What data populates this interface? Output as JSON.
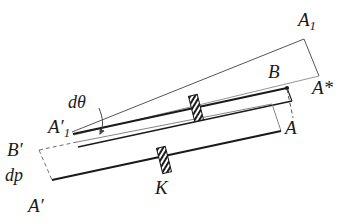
{
  "figure": {
    "background_color": "#ffffff",
    "stroke_color": "#1a1a1a",
    "thin_stroke_color": "#555555",
    "dashed_stroke_color": "#707070",
    "labels": {
      "A1": {
        "base": "A",
        "sub": "1",
        "prime": ""
      },
      "B": {
        "base": "B",
        "sub": "",
        "prime": ""
      },
      "A_star": {
        "base": "A",
        "sub": "",
        "prime": "*"
      },
      "A": {
        "base": "A",
        "sub": "",
        "prime": ""
      },
      "d_theta": {
        "text": "dθ"
      },
      "A1_prime": {
        "base": "A",
        "sub": "1",
        "prime": "′"
      },
      "B_prime": {
        "base": "B",
        "sub": "",
        "prime": "′"
      },
      "dp": {
        "text": "dp"
      },
      "A_prime": {
        "base": "A",
        "sub": "",
        "prime": "′"
      },
      "K": {
        "base": "K",
        "sub": "",
        "prime": ""
      }
    },
    "geometry": {
      "rotated_bar": {
        "name": "rotated-bar",
        "vertices": [
          [
            72,
            132
          ],
          [
            305,
            38
          ],
          [
            320,
            76
          ],
          [
            86,
            142
          ]
        ],
        "description": "thin outlined bar rotated by dθ about A1'"
      },
      "upper_bar": {
        "name": "upper-bar",
        "top_edge": [
          [
            72,
            132
          ],
          [
            288,
            88
          ]
        ],
        "bottom_edge": [
          [
            80,
            146
          ],
          [
            293,
            102
          ]
        ],
        "right_edge_dashed": [
          [
            288,
            88
          ],
          [
            293,
            116
          ]
        ],
        "description": "bar from A1' to B (thick top line) and A"
      },
      "lower_bar": {
        "name": "lower-bar",
        "vertices": [
          [
            40,
            150
          ],
          [
            272,
            104
          ],
          [
            281,
            131
          ],
          [
            50,
            180
          ]
        ],
        "description": "original bar B'-A with left edge dashed from B' to A'"
      },
      "hatch_markers": [
        {
          "name": "hatch-marker-upper",
          "cx": 196,
          "cy": 108,
          "angle": -14
        },
        {
          "name": "hatch-marker-lower",
          "cx": 164,
          "cy": 160,
          "angle": -14
        }
      ],
      "angle_arc": {
        "name": "d-theta-arc",
        "vertex": [
          72,
          132
        ],
        "label_anchor": [
          92,
          100
        ]
      }
    }
  }
}
